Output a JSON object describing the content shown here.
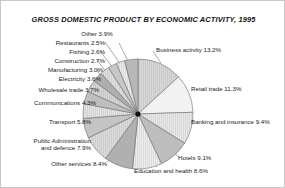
{
  "figure": {
    "title": "GROSS DOMESTIC PRODUCT BY ECONOMIC ACTIVITY, 1995",
    "background": "#ffffff",
    "border_color": "#c9c9c9",
    "text_color": "#1b1b1b"
  },
  "chart_data": {
    "type": "pie",
    "title": "GROSS DOMESTIC PRODUCT BY ECONOMIC ACTIVITY, 1995",
    "xlabel": "",
    "ylabel": "",
    "units": "percent",
    "legend_position": "none",
    "labels_outside": true,
    "leader_lines": true,
    "start_angle_deg": 90,
    "direction": "clockwise",
    "categories": [
      "Business activity",
      "Retail trade",
      "Banking and insurance",
      "Hotels",
      "Education and health",
      "Other services",
      "Public Administration and defence",
      "Transport",
      "Communications",
      "Wholesale trade",
      "Electricity",
      "Manufacturing",
      "Construction",
      "Fishing",
      "Restaurants",
      "Other"
    ],
    "values": [
      13.2,
      11.3,
      9.4,
      9.1,
      8.6,
      8.4,
      7.9,
      5.8,
      4.3,
      3.7,
      3.6,
      3.0,
      2.7,
      2.6,
      2.5,
      3.9
    ],
    "slice_colors": [
      "#d9d9d9",
      "#f2f2f2",
      "#e8e8e8",
      "#bdbdbd",
      "#ededed",
      "#b0b0b0",
      "#dcdcdc",
      "#c4c4c4",
      "#e4e4e4",
      "#bfbfbf",
      "#d6d6d6",
      "#aeaeae",
      "#e0e0e0",
      "#c8c8c8",
      "#ececec",
      "#b8b8b8"
    ],
    "slice_edge_color": "#6b6b6b",
    "hub_color": "#111111",
    "labels": [
      {
        "name": "Business activity",
        "text": "Business activity 13.2%"
      },
      {
        "name": "Retail trade",
        "text": "Retail trade 11.3%"
      },
      {
        "name": "Banking and insurance",
        "text": "Banking and insurance 9.4%"
      },
      {
        "name": "Hotels",
        "text": "Hotels 9.1%"
      },
      {
        "name": "Education and health",
        "text": "Education and health 8.6%"
      },
      {
        "name": "Other services",
        "text": "Other services 8.4%"
      },
      {
        "name": "Public Administration and defence",
        "text": "Public Administration and defence 7.9%"
      },
      {
        "name": "Transport",
        "text": "Transport 5.8%"
      },
      {
        "name": "Communications",
        "text": "Communications 4.3%"
      },
      {
        "name": "Wholesale trade",
        "text": "Wholesale trade 3.7%"
      },
      {
        "name": "Electricity",
        "text": "Electricity 3.6%"
      },
      {
        "name": "Manufacturing",
        "text": "Manufacturing 3.0%"
      },
      {
        "name": "Construction",
        "text": "Construction 2.7%"
      },
      {
        "name": "Fishing",
        "text": "Fishing 2.6%"
      },
      {
        "name": "Restaurants",
        "text": "Restaurants 2.5%"
      },
      {
        "name": "Other",
        "text": "Other 3.9%"
      }
    ]
  },
  "callouts": {
    "other": "Other 3.9%",
    "restaurants": "Restaurants 2.5%",
    "fishing": "Fishing 2.6%",
    "construction": "Construction 2.7%",
    "manufacturing": "Manufacturing 3.0%",
    "electricity": "Electricity 3.6%",
    "wholesale_trade": "Wholesale trade 3.7%",
    "communications": "Communications 4.3%",
    "transport": "Transport 5.8%",
    "public_admin_line1": "Public Administration",
    "public_admin_line2": "and defence 7.9%",
    "other_services": "Other services 8.4%",
    "education_health": "Education and health 8.6%",
    "hotels": "Hotels 9.1%",
    "banking_insurance": "Banking and insurance 9.4%",
    "retail_trade": "Retail trade 11.3%",
    "business_activity": "Business activity 13.2%"
  }
}
